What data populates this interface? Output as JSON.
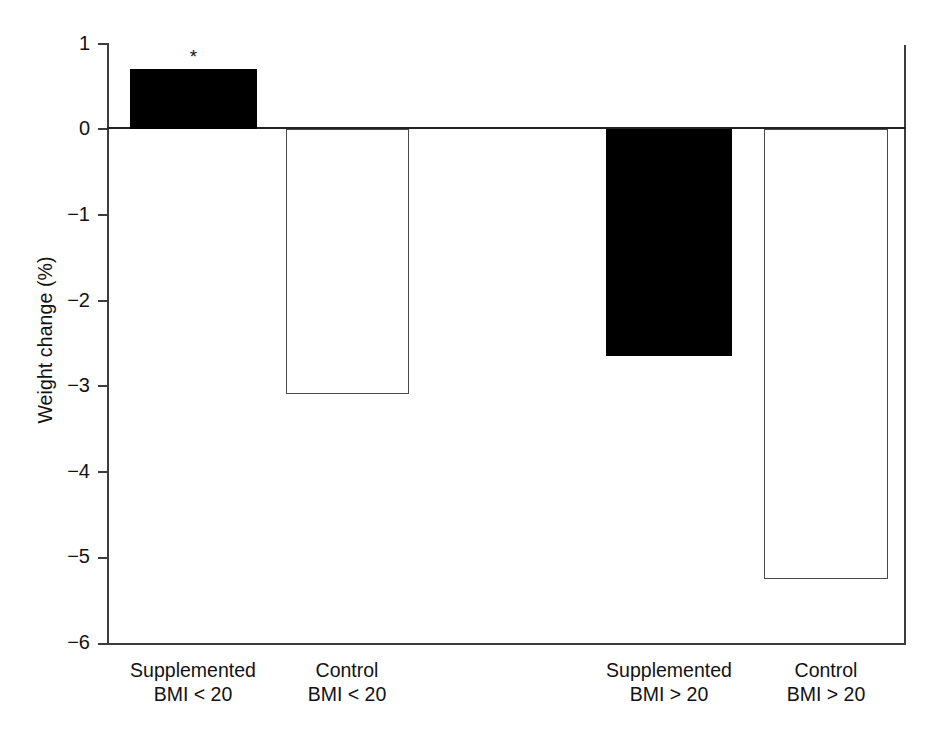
{
  "chart_data": {
    "type": "bar",
    "title": "",
    "xlabel": "",
    "ylabel": "Weight change (%)",
    "ylim": [
      -6,
      1
    ],
    "yticks": [
      1,
      0,
      -1,
      -2,
      -3,
      -4,
      -5,
      -6
    ],
    "ytick_labels": [
      "1",
      "0",
      "−1",
      "−2",
      "−3",
      "−4",
      "−5",
      "−6"
    ],
    "grid": false,
    "legend": "none",
    "categories": [
      "Supplemented BMI < 20",
      "Control BMI < 20",
      "Supplemented BMI > 20",
      "Control BMI > 20"
    ],
    "values": [
      0.7,
      -3.1,
      -2.65,
      -5.25
    ],
    "bar_styles": [
      "filled",
      "hollow",
      "filled",
      "hollow"
    ],
    "annotations": [
      {
        "text": "*",
        "category": "Supplemented BMI < 20",
        "value": 0.7
      }
    ]
  },
  "axes": {
    "y_title": "Weight change (%)",
    "ticks": [
      {
        "label": "1"
      },
      {
        "label": "0"
      },
      {
        "label": "−1"
      },
      {
        "label": "−2"
      },
      {
        "label": "−3"
      },
      {
        "label": "−4"
      },
      {
        "label": "−5"
      },
      {
        "label": "−6"
      }
    ]
  },
  "bars": [
    {
      "group": "Supplemented",
      "subgroup": "BMI < 20",
      "label_line1": "Supplemented",
      "label_line2": "BMI < 20",
      "value": 0.7,
      "style": "filled",
      "marker": "*"
    },
    {
      "group": "Control",
      "subgroup": "BMI < 20",
      "label_line1": "Control",
      "label_line2": "BMI < 20",
      "value": -3.1,
      "style": "hollow",
      "marker": ""
    },
    {
      "group": "Supplemented",
      "subgroup": "BMI > 20",
      "label_line1": "Supplemented",
      "label_line2": "BMI > 20",
      "value": -2.65,
      "style": "filled",
      "marker": ""
    },
    {
      "group": "Control",
      "subgroup": "BMI > 20",
      "label_line1": "Control",
      "label_line2": "BMI > 20",
      "value": -5.25,
      "style": "hollow",
      "marker": ""
    }
  ],
  "colors": {
    "filled_bar": "#000000",
    "hollow_bar_border": "#4a4a4a",
    "axis": "#3c3c3c",
    "background": "#ffffff",
    "text": "#121212"
  }
}
